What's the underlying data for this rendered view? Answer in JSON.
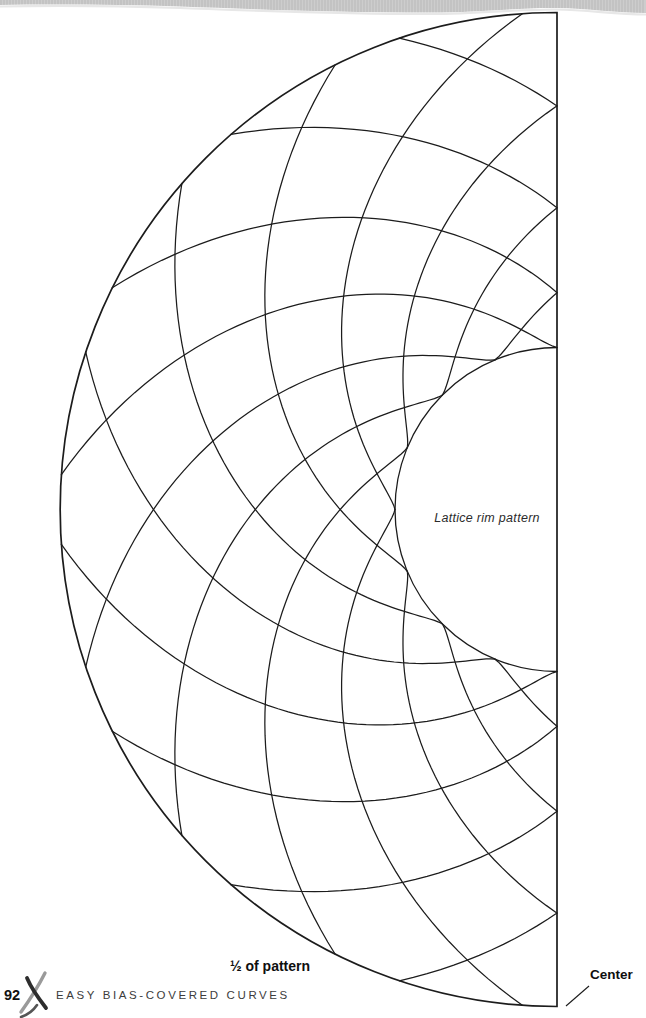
{
  "page": {
    "number": "92",
    "running_title": "EASY BIAS-COVERED CURVES",
    "background": "#ffffff"
  },
  "header_band": {
    "base_color": "#cdcdcd",
    "rib_color": "#bdbdbd",
    "edge_shadow_color": "#e7e7e7"
  },
  "diagram": {
    "labels": {
      "center_area": "Lattice rim pattern",
      "half_note": "½ of pattern",
      "center_edge": "Center"
    },
    "geometry": {
      "cx": 557,
      "cy": 509.5,
      "outer_radius": 497,
      "inner_radius": 162,
      "cusp_count": 16,
      "sweep_deg": 86,
      "radial_exponent": 1.35,
      "line_color": "#1c1c1c",
      "boundary_width": 1.7,
      "curve_width": 1.25
    }
  }
}
